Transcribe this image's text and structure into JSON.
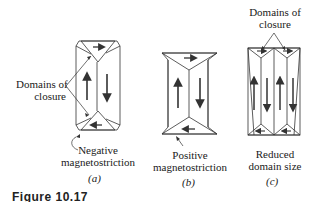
{
  "panels": [
    {
      "id": "a",
      "caption": "(a)",
      "label_closure_line1": "Domains of",
      "label_closure_line2": "closure",
      "label_bottom_line1": "Negative",
      "label_bottom_line2": "magnetostriction"
    },
    {
      "id": "b",
      "caption": "(b)",
      "label_bottom_line1": "Positive",
      "label_bottom_line2": "magnetostriction"
    },
    {
      "id": "c",
      "caption": "(c)",
      "label_top_line1": "Domains of",
      "label_top_line2": "closure",
      "label_bottom_line1": "Reduced",
      "label_bottom_line2": "domain size"
    }
  ],
  "figure_caption": "Figure 10.17"
}
